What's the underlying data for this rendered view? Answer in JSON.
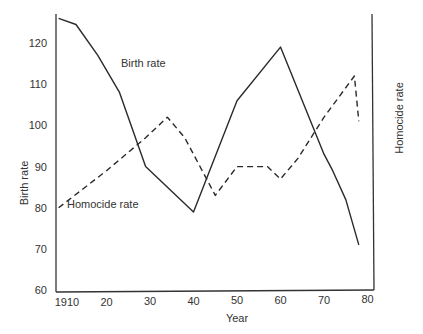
{
  "chart_data": {
    "type": "line",
    "title": "",
    "xlabel": "Year",
    "ylabel": "Birth rate",
    "ylabel_right": "Homocide rate",
    "xlim": [
      1909,
      1980
    ],
    "ylim": [
      60,
      126
    ],
    "x_ticks": [
      "1910",
      "20",
      "30",
      "40",
      "50",
      "60",
      "70",
      "80"
    ],
    "y_ticks": [
      "60",
      "70",
      "80",
      "90",
      "100",
      "110",
      "120"
    ],
    "grid": false,
    "legend": "inline labels",
    "series": [
      {
        "name": "Birth rate",
        "style": "solid",
        "x": [
          1909,
          1913,
          1918,
          1923,
          1929,
          1940,
          1950,
          1960,
          1970,
          1972,
          1975,
          1978
        ],
        "y": [
          126,
          124.5,
          117,
          108,
          90,
          79,
          106,
          119,
          93,
          89,
          82,
          71
        ]
      },
      {
        "name": "Homocide rate",
        "style": "dashed",
        "x": [
          1909,
          1920,
          1929,
          1934,
          1938,
          1945,
          1950,
          1957,
          1960,
          1964,
          1970,
          1977,
          1978
        ],
        "y": [
          80,
          89,
          97,
          102,
          97,
          83,
          90,
          90,
          87,
          92,
          102,
          112,
          101
        ]
      }
    ],
    "annotations": [
      {
        "text": "Birth rate",
        "near": [
          1922,
          113
        ]
      },
      {
        "text": "Homocide rate",
        "near": [
          1913,
          79
        ]
      }
    ]
  }
}
